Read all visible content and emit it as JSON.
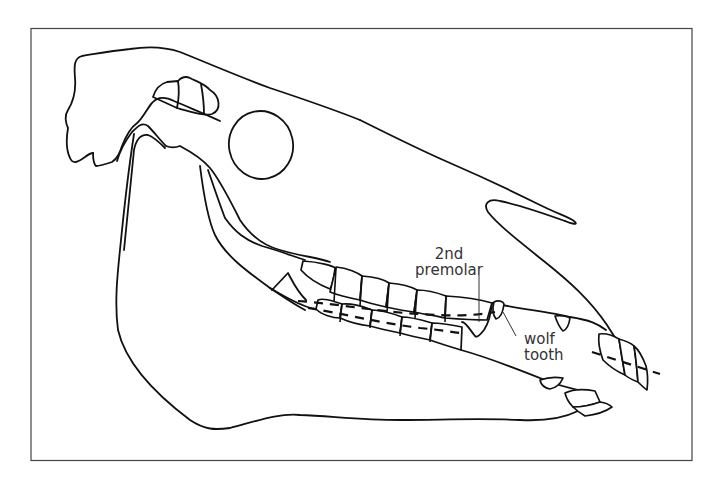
{
  "figure": {
    "labels": {
      "premolar_line1": "2nd",
      "premolar_line2": "premolar",
      "wolf_line1": "wolf",
      "wolf_line2": "tooth"
    },
    "colors": {
      "line": "#111111",
      "label": "#333333",
      "frame": "#444444",
      "background": "#ffffff"
    }
  }
}
